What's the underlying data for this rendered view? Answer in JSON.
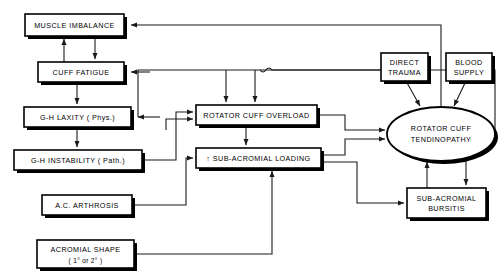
{
  "diagram": {
    "type": "flowchart",
    "colors": {
      "background": "#ffffff",
      "stroke": "#000000",
      "edge": "#1a1a1a",
      "shadow": "#000000"
    },
    "nodes": [
      {
        "id": "muscle-imbalance",
        "shape": "rect",
        "line1": "MUSCLE IMBALANCE",
        "line2": "",
        "x": 25,
        "y": 14,
        "w": 99,
        "h": 22
      },
      {
        "id": "cuff-fatigue",
        "shape": "rect",
        "line1": "CUFF FATIGUE",
        "line2": "",
        "x": 38,
        "y": 62,
        "w": 86,
        "h": 20
      },
      {
        "id": "gh-laxity",
        "shape": "rect",
        "line1": "G-H LAXITY ( Phys.)",
        "line2": "",
        "x": 24,
        "y": 107,
        "w": 107,
        "h": 20
      },
      {
        "id": "gh-instability",
        "shape": "rect",
        "line1": "G-H INSTABILITY ( Path.)",
        "line2": "",
        "x": 14,
        "y": 150,
        "w": 128,
        "h": 20
      },
      {
        "id": "ac-arthrosis",
        "shape": "rect",
        "line1": "A.C. ARTHROSIS",
        "line2": "",
        "x": 42,
        "y": 195,
        "w": 90,
        "h": 20
      },
      {
        "id": "acromial-shape",
        "shape": "rect",
        "line1": "ACROMIAL SHAPE",
        "line2": "( 1° or 2° )",
        "x": 37,
        "y": 240,
        "w": 97,
        "h": 28
      },
      {
        "id": "rotator-cuff-overload",
        "shape": "rect",
        "line1": "ROTATOR CUFF OVERLOAD",
        "line2": "",
        "x": 196,
        "y": 105,
        "w": 121,
        "h": 20
      },
      {
        "id": "sub-acromial-loading",
        "shape": "rect",
        "line1": "↑ SUB-ACROMIAL LOADING",
        "line2": "",
        "x": 196,
        "y": 148,
        "w": 125,
        "h": 20
      },
      {
        "id": "direct-trauma",
        "shape": "rect",
        "line1": "DIRECT",
        "line2": "TRAUMA",
        "x": 381,
        "y": 53,
        "w": 47,
        "h": 28
      },
      {
        "id": "blood-supply",
        "shape": "rect",
        "line1": "BLOOD",
        "line2": "SUPPLY",
        "x": 446,
        "y": 53,
        "w": 46,
        "h": 28
      },
      {
        "id": "sub-acromial-bursitis",
        "shape": "rect",
        "line1": "SUB-ACROMIAL",
        "line2": "BURSITIS",
        "x": 407,
        "y": 188,
        "w": 79,
        "h": 30
      },
      {
        "id": "rotator-cuff-tendinopathy",
        "shape": "ellipse",
        "line1": "ROTATOR CUFF",
        "line2": "TENDINOPATHY",
        "cx": 441,
        "cy": 134,
        "rx": 54,
        "ry": 27
      }
    ],
    "edges": [
      {
        "id": "edge-cuff-fatigue-to-muscle-imbalance",
        "from": "cuff-fatigue",
        "to": "muscle-imbalance"
      },
      {
        "id": "edge-muscle-imbalance-to-cuff-fatigue",
        "from": "muscle-imbalance",
        "to": "cuff-fatigue"
      },
      {
        "id": "edge-cuff-fatigue-to-gh-laxity",
        "from": "cuff-fatigue",
        "to": "gh-laxity"
      },
      {
        "id": "edge-gh-laxity-to-gh-instability",
        "from": "gh-laxity",
        "to": "gh-instability"
      },
      {
        "id": "edge-gh-laxity-to-overload",
        "from": "gh-laxity",
        "to": "rotator-cuff-overload"
      },
      {
        "id": "edge-gh-instability-to-overload",
        "from": "gh-instability",
        "to": "rotator-cuff-overload"
      },
      {
        "id": "edge-gh-instability-to-loading",
        "from": "gh-instability",
        "to": "sub-acromial-loading"
      },
      {
        "id": "edge-ac-arthrosis-to-loading",
        "from": "ac-arthrosis",
        "to": "sub-acromial-loading"
      },
      {
        "id": "edge-acromial-shape-to-loading",
        "from": "acromial-shape",
        "to": "sub-acromial-loading"
      },
      {
        "id": "edge-overload-to-loading",
        "from": "rotator-cuff-overload",
        "to": "sub-acromial-loading"
      },
      {
        "id": "edge-overload-to-tendinopathy",
        "from": "rotator-cuff-overload",
        "to": "rotator-cuff-tendinopathy"
      },
      {
        "id": "edge-loading-to-tendinopathy",
        "from": "sub-acromial-loading",
        "to": "rotator-cuff-tendinopathy"
      },
      {
        "id": "edge-loading-to-bursitis",
        "from": "sub-acromial-loading",
        "to": "sub-acromial-bursitis"
      },
      {
        "id": "edge-direct-trauma-to-tendinopathy",
        "from": "direct-trauma",
        "to": "rotator-cuff-tendinopathy"
      },
      {
        "id": "edge-blood-supply-to-tendinopathy",
        "from": "blood-supply",
        "to": "rotator-cuff-tendinopathy"
      },
      {
        "id": "edge-tendinopathy-to-bursitis",
        "from": "rotator-cuff-tendinopathy",
        "to": "sub-acromial-bursitis"
      },
      {
        "id": "edge-bursitis-to-tendinopathy",
        "from": "sub-acromial-bursitis",
        "to": "rotator-cuff-tendinopathy"
      },
      {
        "id": "edge-direct-trauma-to-cuff-fatigue",
        "from": "direct-trauma",
        "to": "cuff-fatigue"
      },
      {
        "id": "edge-tendinopathy-to-muscle-imbalance",
        "from": "rotator-cuff-tendinopathy",
        "to": "muscle-imbalance"
      },
      {
        "id": "edge-tendinopathy-to-gh-laxity",
        "from": "rotator-cuff-tendinopathy",
        "to": "gh-laxity"
      }
    ]
  }
}
